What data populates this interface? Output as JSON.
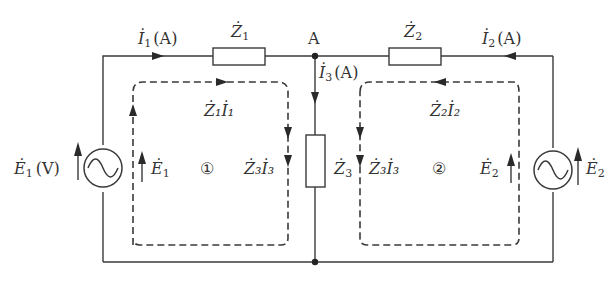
{
  "diagram": {
    "type": "AC circuit with two mesh loops (Kirchhoff voltage law)",
    "node_label": "A",
    "branches": {
      "left": {
        "current": "İ1",
        "unit": "[A]",
        "impedance": "Ż1",
        "source": "Ė1",
        "source_unit": "[V]"
      },
      "middle": {
        "current": "İ3",
        "unit": "[A]",
        "impedance": "Ż3"
      },
      "right": {
        "current": "İ2",
        "unit": "[A]",
        "impedance": "Ż2",
        "source": "Ė2"
      }
    },
    "loops": [
      {
        "id": "①",
        "labels": {
          "top": "Ż1İ1",
          "left": "Ė1",
          "right": "Ż3İ3"
        }
      },
      {
        "id": "②",
        "labels": {
          "top": "Ż2İ2",
          "left": "Ż3İ3",
          "right": "Ė2"
        }
      }
    ],
    "text": {
      "i1": "İ",
      "i1_sub": "1",
      "i1_unit": "(A)",
      "z1": "Ż",
      "z1_sub": "1",
      "node": "A",
      "z2": "Ż",
      "z2_sub": "2",
      "i2": "İ",
      "i2_sub": "2",
      "i2_unit": "(A)",
      "i3": "İ",
      "i3_sub": "3",
      "i3_unit": "(A)",
      "z1i1": "Ż₁İ₁",
      "z2i2": "Ż₂İ₂",
      "e1_src": "Ė",
      "e1_src_sub": "1",
      "e1_unit": "(V)",
      "e1_loop": "Ė",
      "e1_loop_sub": "1",
      "loop1": "①",
      "z3i3_left": "Ż₃İ₃",
      "z3": "Ż",
      "z3_sub": "3",
      "z3i3_right": "Ż₃İ₃",
      "loop2": "②",
      "e2_loop": "Ė",
      "e2_loop_sub": "2",
      "e2_src": "Ė",
      "e2_src_sub": "2"
    }
  }
}
